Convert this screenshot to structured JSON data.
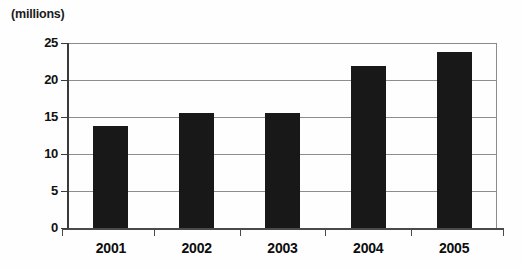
{
  "chart_data": {
    "type": "bar",
    "title": "",
    "subtitle": "",
    "unit_caption": "(millions)",
    "xlabel": "",
    "ylabel": "",
    "categories": [
      "2001",
      "2002",
      "2003",
      "2004",
      "2005"
    ],
    "values": [
      13.8,
      15.5,
      15.6,
      21.9,
      23.8
    ],
    "series": [
      {
        "name": "",
        "values": [
          13.8,
          15.5,
          15.6,
          21.9,
          23.8
        ]
      }
    ],
    "ylim": [
      0,
      25
    ],
    "y_ticks": [
      "0",
      "5",
      "10",
      "15",
      "20",
      "25"
    ],
    "y_tick_values": [
      0,
      5,
      10,
      15,
      20,
      25
    ],
    "grid": true,
    "grid_axis": "y",
    "legend": false,
    "legend_position": "none",
    "bar_color": "#181818",
    "gridline_color": "#8d8d8d",
    "axis_color": "#3a3a3a",
    "background_color": "#ffffff"
  }
}
